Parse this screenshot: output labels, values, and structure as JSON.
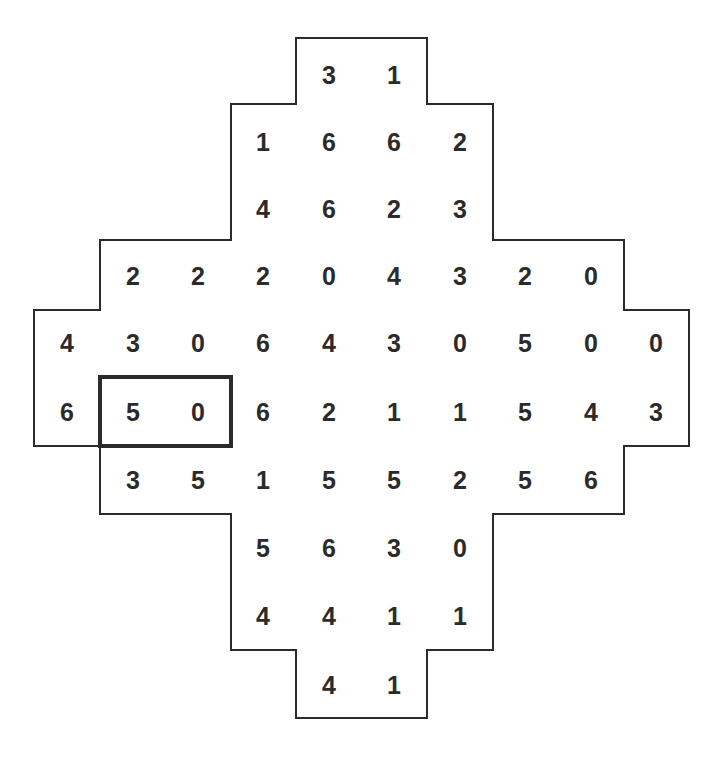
{
  "puzzle": {
    "type": "domino-grid",
    "grid_rows": 10,
    "grid_cols": 10,
    "cells": [
      {
        "row": 0,
        "col": 4,
        "value": "3"
      },
      {
        "row": 0,
        "col": 5,
        "value": "1"
      },
      {
        "row": 1,
        "col": 3,
        "value": "1"
      },
      {
        "row": 1,
        "col": 4,
        "value": "6"
      },
      {
        "row": 1,
        "col": 5,
        "value": "6"
      },
      {
        "row": 1,
        "col": 6,
        "value": "2"
      },
      {
        "row": 2,
        "col": 3,
        "value": "4"
      },
      {
        "row": 2,
        "col": 4,
        "value": "6"
      },
      {
        "row": 2,
        "col": 5,
        "value": "2"
      },
      {
        "row": 2,
        "col": 6,
        "value": "3"
      },
      {
        "row": 3,
        "col": 1,
        "value": "2"
      },
      {
        "row": 3,
        "col": 2,
        "value": "2"
      },
      {
        "row": 3,
        "col": 3,
        "value": "2"
      },
      {
        "row": 3,
        "col": 4,
        "value": "0"
      },
      {
        "row": 3,
        "col": 5,
        "value": "4"
      },
      {
        "row": 3,
        "col": 6,
        "value": "3"
      },
      {
        "row": 3,
        "col": 7,
        "value": "2"
      },
      {
        "row": 3,
        "col": 8,
        "value": "0"
      },
      {
        "row": 4,
        "col": 0,
        "value": "4"
      },
      {
        "row": 4,
        "col": 1,
        "value": "3"
      },
      {
        "row": 4,
        "col": 2,
        "value": "0"
      },
      {
        "row": 4,
        "col": 3,
        "value": "6"
      },
      {
        "row": 4,
        "col": 4,
        "value": "4"
      },
      {
        "row": 4,
        "col": 5,
        "value": "3"
      },
      {
        "row": 4,
        "col": 6,
        "value": "0"
      },
      {
        "row": 4,
        "col": 7,
        "value": "5"
      },
      {
        "row": 4,
        "col": 8,
        "value": "0"
      },
      {
        "row": 4,
        "col": 9,
        "value": "0"
      },
      {
        "row": 5,
        "col": 0,
        "value": "6"
      },
      {
        "row": 5,
        "col": 1,
        "value": "5"
      },
      {
        "row": 5,
        "col": 2,
        "value": "0"
      },
      {
        "row": 5,
        "col": 3,
        "value": "6"
      },
      {
        "row": 5,
        "col": 4,
        "value": "2"
      },
      {
        "row": 5,
        "col": 5,
        "value": "1"
      },
      {
        "row": 5,
        "col": 6,
        "value": "1"
      },
      {
        "row": 5,
        "col": 7,
        "value": "5"
      },
      {
        "row": 5,
        "col": 8,
        "value": "4"
      },
      {
        "row": 5,
        "col": 9,
        "value": "3"
      },
      {
        "row": 6,
        "col": 1,
        "value": "3"
      },
      {
        "row": 6,
        "col": 2,
        "value": "5"
      },
      {
        "row": 6,
        "col": 3,
        "value": "1"
      },
      {
        "row": 6,
        "col": 4,
        "value": "5"
      },
      {
        "row": 6,
        "col": 5,
        "value": "5"
      },
      {
        "row": 6,
        "col": 6,
        "value": "2"
      },
      {
        "row": 6,
        "col": 7,
        "value": "5"
      },
      {
        "row": 6,
        "col": 8,
        "value": "6"
      },
      {
        "row": 7,
        "col": 3,
        "value": "5"
      },
      {
        "row": 7,
        "col": 4,
        "value": "6"
      },
      {
        "row": 7,
        "col": 5,
        "value": "3"
      },
      {
        "row": 7,
        "col": 6,
        "value": "0"
      },
      {
        "row": 8,
        "col": 3,
        "value": "4"
      },
      {
        "row": 8,
        "col": 4,
        "value": "4"
      },
      {
        "row": 8,
        "col": 5,
        "value": "1"
      },
      {
        "row": 8,
        "col": 6,
        "value": "1"
      },
      {
        "row": 9,
        "col": 4,
        "value": "4"
      },
      {
        "row": 9,
        "col": 5,
        "value": "1"
      }
    ],
    "highlighted_domino": {
      "row": 5,
      "col_start": 1,
      "col_end": 2,
      "values": [
        "5",
        "0"
      ]
    },
    "colors": {
      "line": "#2b2b2b",
      "text": "#2b2b2b",
      "background": "#ffffff"
    }
  }
}
